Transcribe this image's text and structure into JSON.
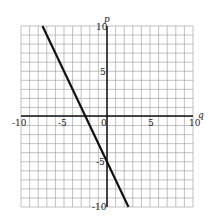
{
  "chart_data": {
    "type": "line",
    "title": "",
    "xlabel": "q",
    "ylabel": "p",
    "xlim": [
      -10,
      10
    ],
    "ylim": [
      -10,
      10
    ],
    "grid": true,
    "grid_step": 1,
    "x_ticks": [
      "-10",
      "-5",
      "0",
      "5",
      "10"
    ],
    "y_ticks": [
      "10",
      "5",
      "-5",
      "-10"
    ],
    "series": [
      {
        "name": "p = -2q - 5",
        "x": [
          -7.5,
          2.5
        ],
        "y": [
          10,
          -10
        ]
      }
    ]
  },
  "labels": {
    "x_axis": "q",
    "y_axis": "p",
    "xt_m10": "-10",
    "xt_m5": "-5",
    "xt_0": "0",
    "xt_5": "5",
    "xt_10": "10",
    "yt_10": "10",
    "yt_5": "5",
    "yt_m5": "-5",
    "yt_m10": "-10"
  }
}
